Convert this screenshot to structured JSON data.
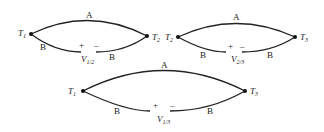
{
  "diagrams": [
    {
      "id": "circuit-1-2",
      "left_terminal": {
        "label": "T",
        "sub": "1"
      },
      "right_terminal": {
        "label": "T",
        "sub": "2"
      },
      "upper_wire": "A",
      "lower_wire_left": "B",
      "lower_wire_right": "B",
      "plus": "+",
      "minus": "–",
      "voltage": {
        "label": "V",
        "sub": "1/2"
      }
    },
    {
      "id": "circuit-2-3",
      "left_terminal": {
        "label": "T",
        "sub": "2"
      },
      "right_terminal": {
        "label": "T",
        "sub": "3"
      },
      "upper_wire": "A",
      "lower_wire_left": "B",
      "lower_wire_right": "B",
      "plus": "+",
      "minus": "–",
      "voltage": {
        "label": "V",
        "sub": "2/3"
      }
    },
    {
      "id": "circuit-1-3",
      "left_terminal": {
        "label": "T",
        "sub": "1"
      },
      "right_terminal": {
        "label": "T",
        "sub": "3"
      },
      "upper_wire": "A",
      "lower_wire_left": "B",
      "lower_wire_right": "B",
      "plus": "+",
      "minus": "–",
      "voltage": {
        "label": "V",
        "sub": "1/3"
      }
    }
  ]
}
